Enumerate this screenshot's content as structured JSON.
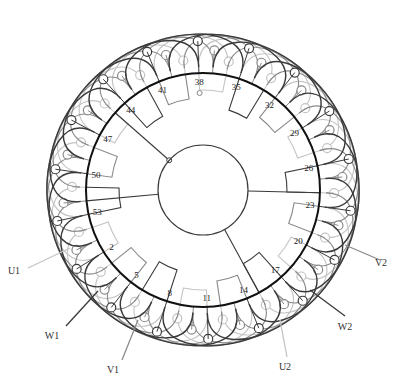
{
  "diagram": {
    "type": "stator-winding-diagram",
    "center": [
      203,
      190
    ],
    "slot_count": 54,
    "stator_radius": 117,
    "inner_radius": 45,
    "colors": {
      "phase_dark": "#3a3a3a",
      "phase_mid": "#8a8a8a",
      "phase_light": "#c4c4c4",
      "stator_ring": "#111111",
      "background": "#ffffff"
    },
    "slot_labels": [
      {
        "text": "2",
        "slot": 2
      },
      {
        "text": "5",
        "slot": 5
      },
      {
        "text": "8",
        "slot": 8
      },
      {
        "text": "11",
        "slot": 11
      },
      {
        "text": "14",
        "slot": 14
      },
      {
        "text": "17",
        "slot": 17
      },
      {
        "text": "20",
        "slot": 20
      },
      {
        "text": "23",
        "slot": 23
      },
      {
        "text": "26",
        "slot": 26
      },
      {
        "text": "29",
        "slot": 29
      },
      {
        "text": "32",
        "slot": 32
      },
      {
        "text": "35",
        "slot": 35
      },
      {
        "text": "38",
        "slot": 38
      },
      {
        "text": "41",
        "slot": 41
      },
      {
        "text": "44",
        "slot": 44
      },
      {
        "text": "47",
        "slot": 47
      },
      {
        "text": "50",
        "slot": 50
      },
      {
        "text": "53",
        "slot": 53
      }
    ],
    "terminals": [
      {
        "label": "U1",
        "x": 14,
        "y": 274,
        "lx1": 28,
        "ly1": 268,
        "lx2": 70,
        "ly2": 248,
        "shade": "light"
      },
      {
        "label": "W1",
        "x": 52,
        "y": 339,
        "lx1": 66,
        "ly1": 326,
        "lx2": 98,
        "ly2": 291,
        "shade": "dark"
      },
      {
        "label": "V1",
        "x": 113,
        "y": 373,
        "lx1": 122,
        "ly1": 360,
        "lx2": 138,
        "ly2": 320,
        "shade": "mid"
      },
      {
        "label": "U2",
        "x": 285,
        "y": 370,
        "lx1": 287,
        "ly1": 357,
        "lx2": 280,
        "ly2": 320,
        "shade": "light"
      },
      {
        "label": "W2",
        "x": 345,
        "y": 330,
        "lx1": 345,
        "ly1": 316,
        "lx2": 310,
        "ly2": 290,
        "shade": "dark"
      },
      {
        "label": "V2",
        "x": 381,
        "y": 266,
        "lx1": 380,
        "ly1": 260,
        "lx2": 345,
        "ly2": 245,
        "shade": "mid"
      }
    ]
  }
}
